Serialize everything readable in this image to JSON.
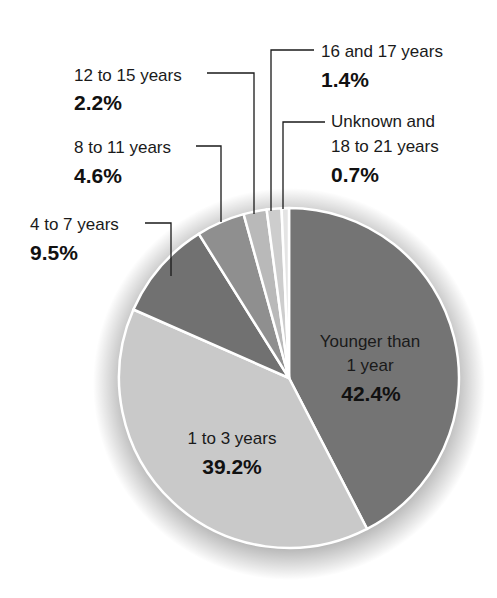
{
  "chart_data": {
    "type": "pie",
    "title": "",
    "categories": [
      "Younger than 1 year",
      "1 to 3 years",
      "4 to 7 years",
      "8 to 11 years",
      "12 to 15 years",
      "16 and 17 years",
      "Unknown and 18 to 21 years"
    ],
    "values": [
      42.4,
      39.2,
      9.5,
      4.6,
      2.2,
      1.4,
      0.7
    ],
    "unit": "%",
    "start_angle": "12 o'clock, clockwise",
    "colors": [
      "#747474",
      "#c9c9c9",
      "#717171",
      "#8f8f8f",
      "#b9b9b9",
      "#cdcdcd",
      "#e4e4e4"
    ]
  },
  "labels": {
    "younger": {
      "line1": "Younger than",
      "line2": "1 year",
      "pct": "42.4%"
    },
    "one_to_three": {
      "line1": "1 to 3 years",
      "pct": "39.2%"
    },
    "four_to_seven": {
      "line1": "4 to 7 years",
      "pct": "9.5%"
    },
    "eight_to_eleven": {
      "line1": "8 to 11 years",
      "pct": "4.6%"
    },
    "twelve_to_fifteen": {
      "line1": "12 to 15 years",
      "pct": "2.2%"
    },
    "sixteen_seventeen": {
      "line1": "16 and 17 years",
      "pct": "1.4%"
    },
    "unknown": {
      "line1": "Unknown and",
      "line2": "18 to 21 years",
      "pct": "0.7%"
    }
  }
}
